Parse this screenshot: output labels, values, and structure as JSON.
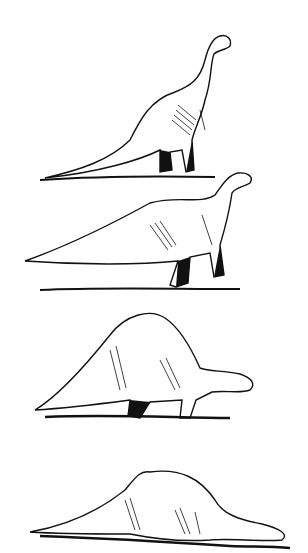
{
  "illustration": {
    "style": "black ink pen drawing on white",
    "background": "#ffffff",
    "ink": "#111111",
    "figures": [
      {
        "pose": "standing upright, head raised",
        "label": ""
      },
      {
        "pose": "walking, head raised forward",
        "label": ""
      },
      {
        "pose": "crouching, head lowered",
        "label": ""
      },
      {
        "pose": "lying on ground, head down",
        "label": ""
      }
    ]
  }
}
